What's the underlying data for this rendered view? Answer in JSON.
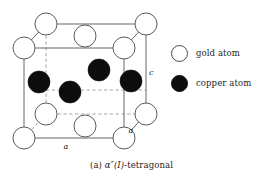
{
  "figure": {
    "caption_prefix": "(a)",
    "caption_symbol": "α″(I)",
    "caption_suffix": "-tetragonal",
    "caption_full": "(a) α″(I)-tetragonal",
    "colors": {
      "gold_atom_fill": "#ffffff",
      "gold_atom_stroke": "#4a4a4a",
      "copper_atom_fill": "#0d0d0d",
      "cell_edge": "#555555",
      "cell_hidden_edge": "#9a9a9a",
      "text": "#242424",
      "background": "#ffffff"
    },
    "axis_labels": [
      {
        "name": "c-axis-label",
        "text": "c",
        "x": 149,
        "y": 75
      },
      {
        "name": "a-axis-bottom-label",
        "text": "a",
        "x": 66,
        "y": 149
      },
      {
        "name": "a-axis-depth-label",
        "text": "a",
        "x": 131,
        "y": 133
      }
    ],
    "cell": {
      "front_face": {
        "left": 24,
        "top": 48,
        "right": 124,
        "bottom": 138
      },
      "back_offset": {
        "dx": 22,
        "dy": -24
      }
    },
    "gold_atoms": [
      {
        "id": "gold-corner-back-top-left",
        "cx": 24,
        "cy": 48,
        "r": 11
      },
      {
        "id": "gold-corner-back-top-right",
        "cx": 124,
        "cy": 48,
        "r": 11
      },
      {
        "id": "gold-corner-top-back-left",
        "cx": 46,
        "cy": 24,
        "r": 11
      },
      {
        "id": "gold-corner-top-back-right",
        "cx": 146,
        "cy": 24,
        "r": 11
      },
      {
        "id": "gold-face-center-top",
        "cx": 85,
        "cy": 36,
        "r": 11
      },
      {
        "id": "gold-corner-front-bot-left",
        "cx": 24,
        "cy": 138,
        "r": 11
      },
      {
        "id": "gold-corner-front-bot-right",
        "cx": 124,
        "cy": 138,
        "r": 11
      },
      {
        "id": "gold-corner-back-bot-left",
        "cx": 46,
        "cy": 114,
        "r": 11
      },
      {
        "id": "gold-corner-back-bot-right",
        "cx": 146,
        "cy": 114,
        "r": 11
      },
      {
        "id": "gold-face-center-bottom",
        "cx": 85,
        "cy": 126,
        "r": 11
      }
    ],
    "copper_atoms": [
      {
        "id": "copper-left",
        "cx": 39,
        "cy": 82,
        "r": 11
      },
      {
        "id": "copper-center-front",
        "cx": 70,
        "cy": 92,
        "r": 11
      },
      {
        "id": "copper-center-back",
        "cx": 99,
        "cy": 70,
        "r": 11
      },
      {
        "id": "copper-right",
        "cx": 131,
        "cy": 81,
        "r": 11
      }
    ]
  },
  "legend": {
    "items": [
      {
        "icon": "open-circle-icon",
        "label": "gold atom",
        "style": "open"
      },
      {
        "icon": "filled-circle-icon",
        "label": "copper atom",
        "style": "filled"
      }
    ]
  }
}
